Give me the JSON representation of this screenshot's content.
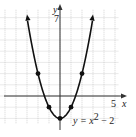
{
  "chart_data": {
    "type": "line",
    "title": "",
    "xlabel": "x",
    "ylabel": "y",
    "xlim": [
      -5,
      5
    ],
    "ylim": [
      -2,
      7
    ],
    "grid": true,
    "tick_labels": {
      "x": [
        "5"
      ],
      "y": [
        "7"
      ]
    },
    "annotations": [
      "y = x² − 2"
    ],
    "series": [
      {
        "name": "y = x^2 - 2",
        "function": "x^2 - 2",
        "x": [
          -3,
          -2,
          -1,
          0,
          1,
          2,
          3
        ],
        "y": [
          7,
          2,
          -1,
          -2,
          -1,
          2,
          7
        ],
        "arrows_at_ends": true
      }
    ],
    "points": [
      {
        "x": -2,
        "y": 2
      },
      {
        "x": -1,
        "y": -1
      },
      {
        "x": 0,
        "y": -2
      },
      {
        "x": 1,
        "y": -1
      },
      {
        "x": 2,
        "y": 2
      }
    ]
  },
  "labels": {
    "x_axis": "x",
    "y_axis": "y",
    "x_tick": "5",
    "y_tick": "7",
    "eq_prefix": "y = x",
    "eq_exp": "2",
    "eq_suffix": " − 2"
  }
}
